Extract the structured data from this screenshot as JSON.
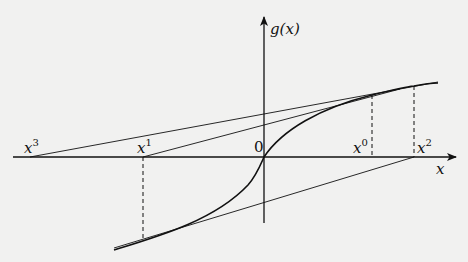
{
  "diagram": {
    "colors": {
      "background": "#f1f1f0",
      "ink": "#111111"
    },
    "axes": {
      "x_label": "x",
      "y_label": "g(x)",
      "origin_label": "0"
    },
    "points": [
      {
        "id": "x3",
        "base": "x",
        "sup": "3"
      },
      {
        "id": "x1",
        "base": "x",
        "sup": "1"
      },
      {
        "id": "x0",
        "base": "x",
        "sup": "0"
      },
      {
        "id": "x2",
        "base": "x",
        "sup": "2"
      }
    ],
    "curve": "g(x)",
    "elements": [
      "increasing S-shaped curve g(x), convex for x<0, concave for x>0, passing through origin",
      "tangent at x0 intersecting x-axis at x1",
      "tangent at x1 intersecting x-axis at x2",
      "tangent at x2 intersecting x-axis at x3",
      "dashed vertical lines at x0, x1, x2 linking axis to curve"
    ]
  }
}
